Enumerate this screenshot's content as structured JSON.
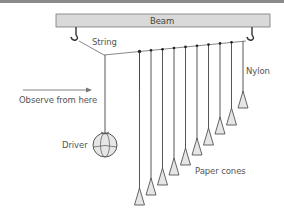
{
  "diagram": {
    "labels": {
      "beam": "Beam",
      "string": "String",
      "nylon": "Nylon",
      "observe": "Observe from here",
      "driver": "Driver",
      "cones": "Paper cones"
    },
    "pendulum_count": 10,
    "colors": {
      "beam_fill": "#d9d9d9",
      "line": "#555555",
      "cone_fill": "#e6e6e6",
      "text": "#555555"
    }
  }
}
